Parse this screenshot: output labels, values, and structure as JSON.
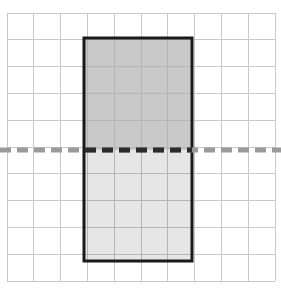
{
  "figure": {
    "title": "Rectangle reflected across a dashed horizontal line of symmetry on a square grid",
    "canvas": {
      "width": 281,
      "height": 289,
      "background": "#ffffff"
    },
    "grid": {
      "name": "square-grid",
      "origin_x": 7,
      "origin_y": 13,
      "cell_size": 26.8,
      "columns": 10,
      "rows": 10,
      "line_color": "#c9c9c9",
      "line_width": 1,
      "border_color": "#c9c9c9"
    },
    "shape": {
      "name": "shaded-rectangle",
      "type": "rectangle",
      "x": 84,
      "y": 38,
      "width": 108,
      "height": 223,
      "width_cells": 4,
      "height_cells": 8.3,
      "outline_color": "#1a1a1a",
      "outline_width": 3,
      "upper_fill": "#c9c9c9",
      "lower_fill": "#e6e6e6",
      "split_y": 150
    },
    "mirror_line": {
      "name": "dashed-mirror-line",
      "type": "dashed-horizontal-line",
      "y": 150,
      "x_start": 0,
      "x_end": 281,
      "color_outside": "#9a9a9a",
      "color_inside": "#2b2b2b",
      "thickness": 5,
      "dash_length": 11,
      "gap_length": 6
    }
  }
}
